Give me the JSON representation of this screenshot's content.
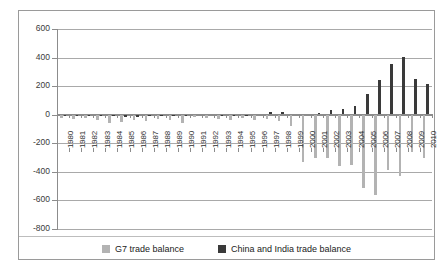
{
  "chart_data": {
    "type": "bar",
    "title": "",
    "subtitle": "",
    "xlabel": "",
    "ylabel": "",
    "ylim": [
      -800,
      600
    ],
    "yticks": [
      600,
      400,
      200,
      0,
      -200,
      -400,
      -600,
      -800
    ],
    "ytick_labels": [
      "600",
      "400",
      "200",
      "0",
      "-200",
      "-400",
      "-600",
      "-800"
    ],
    "grid": true,
    "legend_position": "bottom",
    "categories": [
      "1980",
      "1981",
      "1982",
      "1983",
      "1984",
      "1985",
      "1986",
      "1987",
      "1988",
      "1989",
      "1990",
      "1991",
      "1992",
      "1993",
      "1994",
      "1995",
      "1996",
      "1997",
      "1998",
      "1999",
      "2000",
      "2001",
      "2002",
      "2003",
      "2004",
      "2005",
      "2006",
      "2007",
      "2008",
      "2009",
      "2010"
    ],
    "series": [
      {
        "name": "G7 trade balance",
        "color": "#b3b3b3",
        "values": [
          -22,
          -28,
          -25,
          -38,
          -55,
          -48,
          -40,
          -45,
          -30,
          -35,
          -60,
          -18,
          -22,
          -28,
          -40,
          -25,
          -35,
          -28,
          -45,
          -80,
          -330,
          -300,
          -305,
          -360,
          -350,
          -510,
          -565,
          -385,
          -430,
          -260,
          -300
        ]
      },
      {
        "name": "China and India trade balance",
        "color": "#3a3a3a",
        "values": [
          -5,
          -6,
          -4,
          -6,
          -12,
          -16,
          -14,
          -10,
          -12,
          -12,
          -8,
          8,
          5,
          -4,
          -6,
          -4,
          4,
          22,
          16,
          8,
          6,
          10,
          30,
          40,
          62,
          142,
          240,
          355,
          405,
          252,
          218
        ]
      }
    ]
  },
  "legend": {
    "items": [
      {
        "label": "G7 trade balance",
        "swatch": "g7"
      },
      {
        "label": "China and India trade balance",
        "swatch": "ci"
      }
    ]
  }
}
